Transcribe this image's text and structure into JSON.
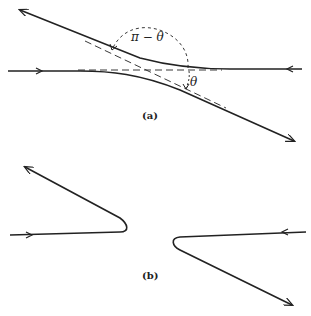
{
  "figure": {
    "panel_a": {
      "caption": "(a)",
      "angle_label_outer": "π − θ",
      "angle_label_inner": "θ"
    },
    "panel_b": {
      "caption": "(b)"
    },
    "colors": {
      "stroke": "#222222",
      "background": "#ffffff"
    }
  }
}
